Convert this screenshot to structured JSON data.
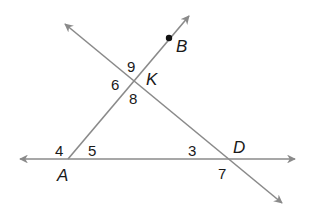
{
  "diagram": {
    "type": "geometry-intersecting-lines",
    "line_color": "#8a8a8a",
    "text_color": "#1a1a1a",
    "points": [
      {
        "name": "A",
        "x": 68,
        "y": 159
      },
      {
        "name": "K",
        "x": 133,
        "y": 80
      },
      {
        "name": "D",
        "x": 231,
        "y": 159
      },
      {
        "name": "B",
        "x": 169,
        "y": 38
      }
    ],
    "point_labels": {
      "A": "A",
      "K": "K",
      "D": "D",
      "B": "B"
    },
    "angle_labels": {
      "a3": "3",
      "a4": "4",
      "a5": "5",
      "a6": "6",
      "a7": "7",
      "a8": "8",
      "a9": "9"
    },
    "lines": [
      {
        "name": "line-AD",
        "from": [
          20,
          159
        ],
        "to": [
          295,
          159
        ],
        "arrows": "both"
      },
      {
        "name": "ray-AB",
        "from": [
          68,
          159
        ],
        "to": [
          189,
          16
        ],
        "arrows": "end"
      },
      {
        "name": "line-KD",
        "from": [
          65,
          24
        ],
        "to": [
          282,
          203
        ],
        "arrows": "both"
      }
    ]
  }
}
